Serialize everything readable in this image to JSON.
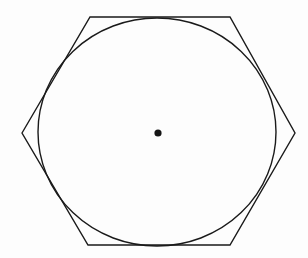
{
  "figure": {
    "background_color": "#fdfdfd",
    "stroke_color": "#1a1a1a",
    "canvas": {
      "width": 308,
      "height": 258
    }
  },
  "chart_data": {
    "type": "scatter",
    "xlabel": "",
    "ylabel": "",
    "grid": false,
    "legend": null,
    "xlim": [
      0,
      308
    ],
    "ylim": [
      0,
      258
    ],
    "shapes": [
      {
        "name": "hexagon",
        "kind": "polygon",
        "sides": 6,
        "stroke": "#1a1a1a",
        "stroke_width": 1.4,
        "fill": "none",
        "center": [
          158,
          133
        ],
        "circumradius": 136,
        "rotation_deg": 0,
        "vertices": [
          [
            22,
            133
          ],
          [
            90,
            17
          ],
          [
            230,
            17
          ],
          [
            295,
            133
          ],
          [
            230,
            245
          ],
          [
            88,
            245
          ]
        ]
      },
      {
        "name": "circle",
        "kind": "ellipse",
        "stroke": "#1a1a1a",
        "stroke_width": 1.4,
        "fill": "none",
        "center": [
          157,
          132
        ],
        "radius_x": 119,
        "radius_y": 114,
        "rotation_deg": 0
      },
      {
        "name": "center-point",
        "kind": "point",
        "fill": "#151515",
        "center": [
          158,
          133
        ],
        "radius": 3.6
      }
    ],
    "annotations": []
  }
}
